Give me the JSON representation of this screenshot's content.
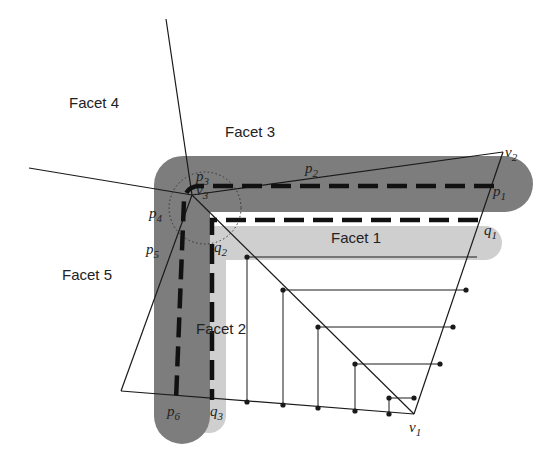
{
  "facets": {
    "f1": "Facet 1",
    "f2": "Facet 2",
    "f3": "Facet 3",
    "f4": "Facet 4",
    "f5": "Facet 5"
  },
  "vertices": {
    "v1": {
      "base": "v",
      "sub": "1"
    },
    "v2": {
      "base": "v",
      "sub": "2"
    },
    "v3": {
      "base": "v",
      "sub": "3"
    }
  },
  "points": {
    "p1": {
      "base": "p",
      "sub": "1"
    },
    "p2": {
      "base": "p",
      "sub": "2"
    },
    "p3": {
      "base": "p",
      "sub": "3"
    },
    "p4": {
      "base": "p",
      "sub": "4"
    },
    "p5": {
      "base": "p",
      "sub": "5"
    },
    "p6": {
      "base": "p",
      "sub": "6"
    },
    "q1": {
      "base": "q",
      "sub": "1"
    },
    "q2": {
      "base": "q",
      "sub": "2"
    },
    "q3": {
      "base": "q",
      "sub": "3"
    }
  },
  "colors": {
    "dark_band": "#7d7d7d",
    "light_band": "#cfcfcf",
    "line": "#1a1a1a"
  }
}
